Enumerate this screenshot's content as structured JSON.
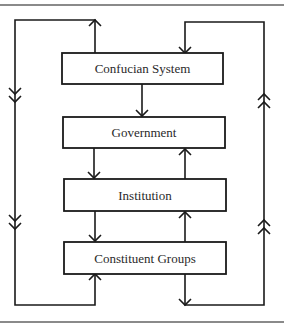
{
  "diagram": {
    "type": "flow",
    "nodes": [
      {
        "id": "confucian",
        "label": "Confucian System"
      },
      {
        "id": "government",
        "label": "Government"
      },
      {
        "id": "institution",
        "label": "Institution"
      },
      {
        "id": "groups",
        "label": "Constituent Groups"
      }
    ],
    "edges": [
      {
        "from": "confucian",
        "to": "government"
      },
      {
        "from": "government",
        "to": "institution"
      },
      {
        "from": "institution",
        "to": "government"
      },
      {
        "from": "institution",
        "to": "groups"
      },
      {
        "from": "groups",
        "to": "institution"
      },
      {
        "from": "confucian",
        "to": "groups",
        "via": "left-loop"
      },
      {
        "from": "groups",
        "to": "confucian",
        "via": "right-loop"
      }
    ]
  }
}
